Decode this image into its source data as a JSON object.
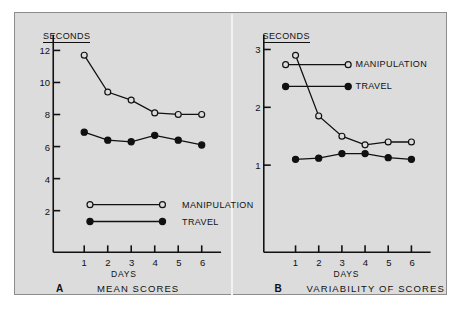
{
  "figure": {
    "background_color": "#dcdcdc",
    "ink_color": "#111111",
    "panels": [
      {
        "letter": "A",
        "caption": "MEAN SCORES",
        "y_axis_title": "SECONDS",
        "x_axis_title": "DAYS",
        "y_ticks": [
          "12",
          "10",
          "8",
          "6",
          "4",
          "2"
        ],
        "x_ticks": [
          "1",
          "2",
          "3",
          "4",
          "5",
          "6"
        ],
        "legend": [
          {
            "label": "MANIPULATION",
            "marker": "open-circle"
          },
          {
            "label": "TRAVEL",
            "marker": "filled-circle"
          }
        ]
      },
      {
        "letter": "B",
        "caption": "VARIABILITY OF SCORES",
        "y_axis_title": "SECONDS",
        "x_axis_title": "DAYS",
        "y_ticks": [
          "3",
          "2",
          "1"
        ],
        "x_ticks": [
          "1",
          "2",
          "3",
          "4",
          "5",
          "6"
        ],
        "legend": [
          {
            "label": "MANIPULATION",
            "marker": "open-circle"
          },
          {
            "label": "TRAVEL",
            "marker": "filled-circle"
          }
        ]
      }
    ]
  },
  "chart_data": [
    {
      "type": "line",
      "panel": "A",
      "title": "MEAN SCORES",
      "xlabel": "DAYS",
      "ylabel": "SECONDS",
      "x": [
        1,
        2,
        3,
        4,
        5,
        6
      ],
      "xlim": [
        0.4,
        6.4
      ],
      "ylim": [
        1.2,
        12.6
      ],
      "yticks": [
        12,
        10,
        8,
        6,
        4,
        2
      ],
      "grid": false,
      "legend_position": "lower-center",
      "series": [
        {
          "name": "MANIPULATION",
          "marker": "open-circle",
          "values": [
            11.7,
            9.4,
            8.9,
            8.1,
            8.0,
            8.0
          ]
        },
        {
          "name": "TRAVEL",
          "marker": "filled-circle",
          "values": [
            6.9,
            6.4,
            6.3,
            6.7,
            6.4,
            6.1
          ]
        }
      ]
    },
    {
      "type": "line",
      "panel": "B",
      "title": "VARIABILITY OF SCORES",
      "xlabel": "DAYS",
      "ylabel": "SECONDS",
      "x": [
        1,
        2,
        3,
        4,
        5,
        6
      ],
      "xlim": [
        0.4,
        6.4
      ],
      "ylim": [
        0.3,
        3.15
      ],
      "yticks": [
        3,
        2,
        1
      ],
      "grid": false,
      "legend_position": "upper-right",
      "series": [
        {
          "name": "MANIPULATION",
          "marker": "open-circle",
          "values": [
            2.9,
            1.85,
            1.5,
            1.35,
            1.4,
            1.4
          ]
        },
        {
          "name": "TRAVEL",
          "marker": "filled-circle",
          "values": [
            1.1,
            1.12,
            1.2,
            1.2,
            1.13,
            1.1
          ]
        }
      ]
    }
  ]
}
